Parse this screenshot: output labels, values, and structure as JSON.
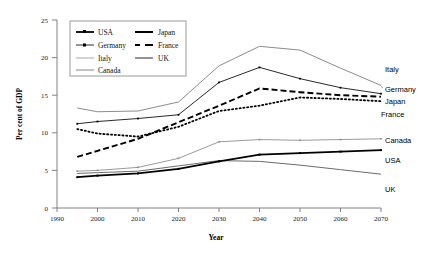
{
  "chart_data": {
    "type": "line",
    "title": "",
    "xlabel": "Year",
    "ylabel": "Per cent of GDP",
    "xlim": [
      1990,
      2070
    ],
    "ylim": [
      0,
      25
    ],
    "xticks": [
      1990,
      2000,
      2010,
      2020,
      2030,
      2040,
      2050,
      2060,
      2070
    ],
    "yticks": [
      0,
      5,
      10,
      15,
      20,
      25
    ],
    "grid": false,
    "legend_position": "top-left-inside",
    "x": [
      1995,
      2000,
      2010,
      2020,
      2030,
      2040,
      2050,
      2060,
      2070
    ],
    "series": [
      {
        "name": "USA",
        "values": [
          4.1,
          4.3,
          4.6,
          5.2,
          6.2,
          7.1,
          7.3,
          7.5,
          7.7
        ],
        "style": "solid-thick-markers",
        "color": "#000000",
        "end_label": "USA"
      },
      {
        "name": "Japan",
        "values": [
          6.8,
          7.6,
          9.2,
          11.4,
          13.6,
          15.9,
          15.4,
          15.0,
          14.8
        ],
        "style": "dashed-thick",
        "color": "#000000",
        "end_label": "Japan"
      },
      {
        "name": "Germany",
        "values": [
          11.2,
          11.5,
          11.9,
          12.4,
          16.7,
          18.7,
          17.2,
          16.0,
          15.2
        ],
        "style": "solid-thin-markers",
        "color": "#000000",
        "end_label": "Germany"
      },
      {
        "name": "France",
        "values": [
          10.5,
          9.9,
          9.5,
          10.8,
          12.9,
          13.6,
          14.7,
          14.5,
          14.2
        ],
        "style": "dotted",
        "color": "#000000",
        "end_label": "France"
      },
      {
        "name": "Italy",
        "values": [
          13.3,
          12.8,
          12.9,
          14.1,
          18.9,
          21.5,
          21.0,
          18.6,
          16.3
        ],
        "style": "solid-thin-gray",
        "color": "#8c8c8c",
        "end_label": "Italy"
      },
      {
        "name": "UK",
        "values": [
          4.6,
          4.7,
          4.9,
          5.6,
          6.3,
          6.2,
          5.7,
          5.1,
          4.5
        ],
        "style": "solid-thin-gray2",
        "color": "#6b6b6b",
        "end_label": "UK"
      },
      {
        "name": "Canada",
        "values": [
          4.9,
          5.0,
          5.4,
          6.6,
          8.8,
          9.1,
          9.0,
          9.1,
          9.2
        ],
        "style": "solid-thin-gray-markers",
        "color": "#9a9a9a",
        "end_label": "Canada"
      }
    ],
    "legend_entries": [
      {
        "label": "USA",
        "swatch": "solid-thick-marker"
      },
      {
        "label": "Japan",
        "swatch": "dash-thick"
      },
      {
        "label": "Germany",
        "swatch": "solid-thin-marker"
      },
      {
        "label": "France",
        "swatch": "dash-dot"
      },
      {
        "label": "Italy",
        "swatch": "solid-thin-gray"
      },
      {
        "label": "UK",
        "swatch": "solid-thin-dark"
      },
      {
        "label": "Canada",
        "swatch": "solid-thin-gray"
      }
    ]
  }
}
